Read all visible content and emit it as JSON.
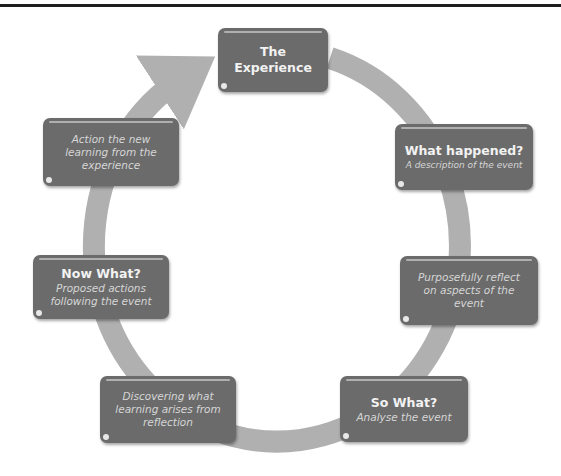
{
  "diagram": {
    "type": "cycle",
    "colors": {
      "box_fill": "#6b6b6b",
      "ring": "#b0b0b0",
      "text_primary": "#f2f2f2",
      "text_secondary": "#d6d6d6"
    },
    "nodes": [
      {
        "id": "experience",
        "title": "The Experience",
        "subtitle": ""
      },
      {
        "id": "what-happened",
        "title": "What happened?",
        "subtitle": "A description of the event"
      },
      {
        "id": "reflect",
        "title": "",
        "subtitle": "Purposefully reflect on aspects of the event"
      },
      {
        "id": "so-what",
        "title": "So What?",
        "subtitle": "Analyse the event"
      },
      {
        "id": "discovering",
        "title": "",
        "subtitle": "Discovering what learning arises from reflection"
      },
      {
        "id": "now-what",
        "title": "Now What?",
        "subtitle": "Proposed actions following the event"
      },
      {
        "id": "action",
        "title": "",
        "subtitle": "Action the new learning from the experience"
      }
    ],
    "flow_direction": "clockwise"
  }
}
